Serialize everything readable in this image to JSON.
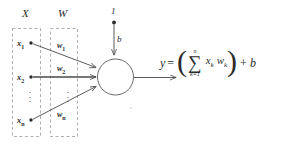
{
  "diagram": {
    "groups": [
      {
        "id": "inputs",
        "label": "X"
      },
      {
        "id": "weights",
        "label": "W"
      }
    ],
    "inputs": [
      {
        "label": "x",
        "sub": "1"
      },
      {
        "label": "x",
        "sub": "2"
      },
      {
        "label": "x",
        "sub": "n"
      }
    ],
    "weights": [
      {
        "label": "w",
        "sub": "1"
      },
      {
        "label": "w",
        "sub": "2"
      },
      {
        "label": "w",
        "sub": "n"
      }
    ],
    "bias": {
      "source_label": "1",
      "weight_label": "b"
    },
    "ellipsis": "·",
    "neuron": {
      "shape": "circle"
    },
    "formula": {
      "output": "y",
      "equals": "=",
      "open_paren": "(",
      "close_paren": ")",
      "sigma": "∑",
      "upper_limit": "n",
      "lower_limit": "k=1",
      "term_x": "x",
      "term_x_sub": "k",
      "term_w": "w",
      "term_w_sub": "k",
      "plus": "+",
      "bias_term": "b"
    },
    "colors": {
      "stroke": "#4a4a4a",
      "text": "#2b2b2b",
      "dashed_box": "#9a9a9a",
      "background": "#ffffff"
    }
  }
}
